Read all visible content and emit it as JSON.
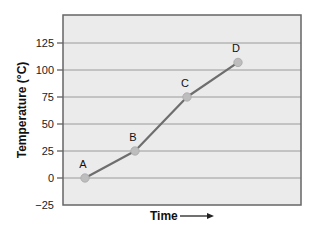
{
  "chart_data": {
    "type": "line",
    "title": "",
    "xlabel": "Time",
    "ylabel": "Temperature (°C)",
    "xlabel_arrow": "right-arrow-icon",
    "ylim": [
      -25,
      150
    ],
    "yticks": [
      -25,
      0,
      25,
      50,
      75,
      100,
      125
    ],
    "grid": true,
    "legend": "none",
    "series": [
      {
        "name": "Temperature",
        "color": "#6e6e6e",
        "points": [
          {
            "label": "A",
            "x": 0,
            "y": 0
          },
          {
            "label": "B",
            "x": 1,
            "y": 25
          },
          {
            "label": "C",
            "x": 2,
            "y": 75
          },
          {
            "label": "D",
            "x": 3,
            "y": 107
          }
        ]
      }
    ],
    "colors": {
      "plot_background": "#ebebeb",
      "gridline": "#9a9a9a",
      "frame": "#666666",
      "marker": "#bdbdbd"
    }
  }
}
